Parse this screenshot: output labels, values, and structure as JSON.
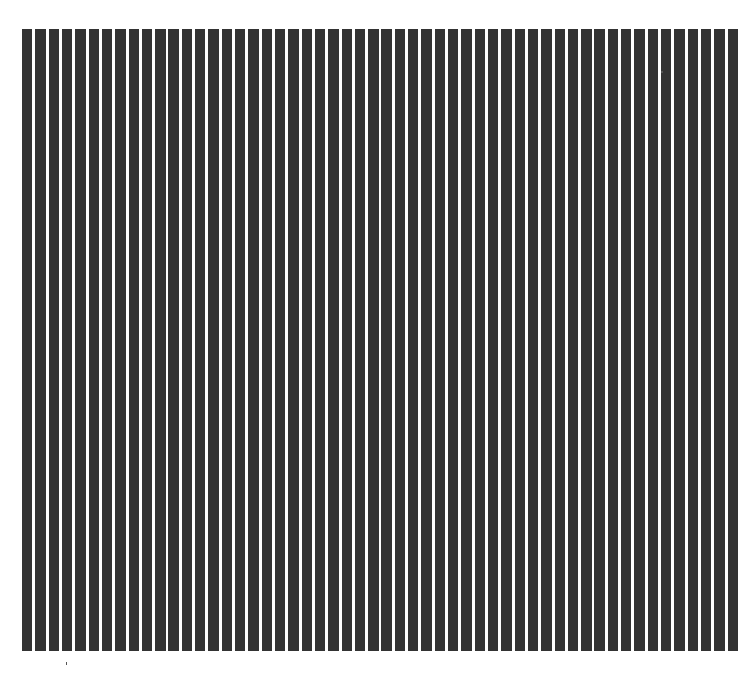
{
  "figure": {
    "bar_count": 54,
    "bar_color": "#333333",
    "background_color": "#ffffff",
    "orientation": "vertical"
  }
}
